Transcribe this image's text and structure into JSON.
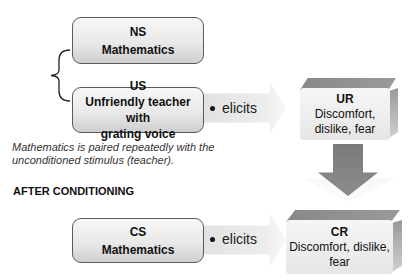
{
  "before": {
    "ns": {
      "title": "NS",
      "text": "Mathematics"
    },
    "us": {
      "title": "US",
      "text_line1": "Unfriendly teacher with",
      "text_line2": "grating voice"
    },
    "elicits": "elicits",
    "ur": {
      "title": "UR",
      "line1": "Discomfort,",
      "line2": "dislike, fear"
    },
    "caption_line1": "Mathematics is paired repeatedly with the",
    "caption_line2": "unconditioned stimulus (teacher)."
  },
  "after": {
    "heading": "AFTER CONDITIONING",
    "cs": {
      "title": "CS",
      "text": "Mathematics"
    },
    "elicits": "elicits",
    "cr": {
      "title": "CR",
      "line1": "Discomfort, dislike,",
      "line2": "fear"
    }
  },
  "colors": {
    "box_border": "#5a5a5a",
    "cube_top": "#888888",
    "arrow_fill": "#e6e6e6",
    "down_arrow": "#808080"
  }
}
